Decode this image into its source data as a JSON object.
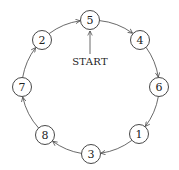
{
  "diagram": {
    "type": "directed-cycle",
    "start_label": "START",
    "start_node": "5",
    "nodes": [
      {
        "id": "5",
        "label": "5",
        "x": 90,
        "y": 20
      },
      {
        "id": "4",
        "label": "4",
        "x": 140,
        "y": 40
      },
      {
        "id": "6",
        "label": "6",
        "x": 159,
        "y": 87
      },
      {
        "id": "1",
        "label": "1",
        "x": 139,
        "y": 134
      },
      {
        "id": "3",
        "label": "3",
        "x": 91,
        "y": 154
      },
      {
        "id": "8",
        "label": "8",
        "x": 45,
        "y": 135
      },
      {
        "id": "7",
        "label": "7",
        "x": 22,
        "y": 87
      },
      {
        "id": "2",
        "label": "2",
        "x": 42,
        "y": 40
      }
    ],
    "edges": [
      {
        "from": "5",
        "to": "4"
      },
      {
        "from": "4",
        "to": "6"
      },
      {
        "from": "6",
        "to": "1"
      },
      {
        "from": "1",
        "to": "3"
      },
      {
        "from": "3",
        "to": "8"
      },
      {
        "from": "8",
        "to": "7"
      },
      {
        "from": "7",
        "to": "2"
      },
      {
        "from": "2",
        "to": "5"
      }
    ],
    "colors": {
      "stroke": "#333333",
      "background": "#ffffff"
    }
  }
}
